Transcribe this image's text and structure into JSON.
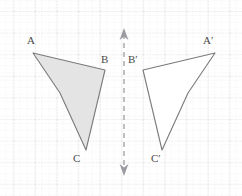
{
  "figure": {
    "canvas": {
      "width": 242,
      "height": 196,
      "background": "#ffffff"
    },
    "grid": {
      "minor_color": "#d8d8dc",
      "major_color": "#c2c2c8",
      "minor_spacing": 7.2,
      "major_spacing": 21.6,
      "origin_x": 13.5,
      "origin_y": 11.0,
      "style": "dotted"
    },
    "mirror_line": {
      "label": "mirror-line",
      "x": 124,
      "y_top": 32,
      "y_bottom": 172,
      "color": "#8c8c92",
      "dash": "5 4",
      "arrow_top": "up-arrowhead",
      "arrow_bottom": "down-arrowhead"
    },
    "preimage": {
      "name": "triangle-abc",
      "fill": "#e3e3e3",
      "stroke": "#7a7a7a",
      "points": "33,53 105,70 86,150 60,93",
      "vertices": [
        {
          "id": "A",
          "label": "A",
          "x": 33,
          "y": 53,
          "label_x": 30,
          "label_y": 38
        },
        {
          "id": "B",
          "label": "B",
          "x": 105,
          "y": 70,
          "label_x": 104,
          "label_y": 57
        },
        {
          "id": "C",
          "label": "C",
          "x": 86,
          "y": 150,
          "label_x": 76,
          "label_y": 156
        }
      ]
    },
    "image": {
      "name": "triangle-a-prime-b-prime-c-prime",
      "fill": "#ffffff",
      "stroke": "#7a7a7a",
      "points": "215,53 143,70 162,150 188,93",
      "vertices": [
        {
          "id": "A'",
          "label": "A′",
          "x": 215,
          "y": 53,
          "label_x": 206,
          "label_y": 38
        },
        {
          "id": "B'",
          "label": "B′",
          "x": 143,
          "y": 70,
          "label_x": 130,
          "label_y": 57
        },
        {
          "id": "C'",
          "label": "C′",
          "x": 162,
          "y": 150,
          "label_x": 154,
          "label_y": 156
        }
      ]
    }
  }
}
